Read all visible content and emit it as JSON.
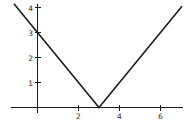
{
  "chart_data": {
    "type": "line",
    "title": "",
    "subtitle": "",
    "xlabel": "",
    "ylabel": "",
    "grid": false,
    "legend": false,
    "legend_position": "none",
    "xlim": [
      -1.15,
      7.05
    ],
    "ylim": [
      -0.25,
      4.2
    ],
    "x_ticks": [
      2,
      4,
      6
    ],
    "x_tick_labels": [
      "2",
      "4",
      "6"
    ],
    "y_ticks": [
      1,
      2,
      3,
      4
    ],
    "y_tick_labels": [
      "1",
      "2",
      "3",
      "4"
    ],
    "series": [
      {
        "name": "y = |x - 3|",
        "color": "#1c1c1c",
        "points": [
          {
            "x": -1.15,
            "y": 4.15
          },
          {
            "x": 0,
            "y": 3
          },
          {
            "x": 3,
            "y": 0
          },
          {
            "x": 7.05,
            "y": 4.05
          }
        ]
      }
    ],
    "annotations": [
      {
        "label": "vertex",
        "x": 3,
        "y": 0
      },
      {
        "label": "y-intercept",
        "x": 0,
        "y": 3
      }
    ],
    "axis_color": "#1a1a1a",
    "background_color": "#ffffff"
  },
  "x_tick_labels": {
    "0": "2",
    "1": "4",
    "2": "6"
  },
  "y_tick_labels": {
    "0": "1",
    "1": "2",
    "2": "3",
    "3": "4"
  }
}
